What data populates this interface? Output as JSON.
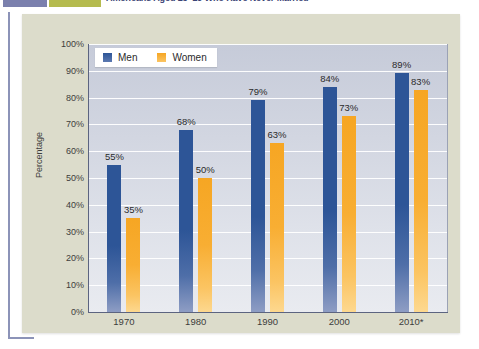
{
  "header": {
    "title": "Americans Aged 25–29 Who Have Never Married",
    "swatch_blue": "#7b80ad",
    "swatch_olive": "#b5bb4e"
  },
  "legend": {
    "items": [
      {
        "label": "Men",
        "color": "#2d5597"
      },
      {
        "label": "Women",
        "color": "#f6a623"
      }
    ]
  },
  "axes": {
    "y_title": "Percentage",
    "y_ticks": [
      "100%",
      "90%",
      "80%",
      "70%",
      "60%",
      "50%",
      "40%",
      "30%",
      "20%",
      "10%",
      "0%"
    ],
    "x_ticks": [
      "1970",
      "1980",
      "1990",
      "2000",
      "2010*"
    ]
  },
  "chart_data": {
    "type": "bar",
    "title": "Americans Aged 25–29 Who Have Never Married",
    "xlabel": "",
    "ylabel": "Percentage",
    "ylim": [
      0,
      100
    ],
    "grid": true,
    "legend_position": "top-left",
    "categories": [
      "1970",
      "1980",
      "1990",
      "2000",
      "2010*"
    ],
    "series": [
      {
        "name": "Men",
        "color": "#2d5597",
        "values": [
          55,
          68,
          79,
          84,
          89
        ],
        "labels": [
          "55%",
          "68%",
          "79%",
          "84%",
          "89%"
        ]
      },
      {
        "name": "Women",
        "color": "#f6a623",
        "values": [
          35,
          50,
          63,
          73,
          83
        ],
        "labels": [
          "35%",
          "50%",
          "63%",
          "73%",
          "83%"
        ]
      }
    ]
  }
}
